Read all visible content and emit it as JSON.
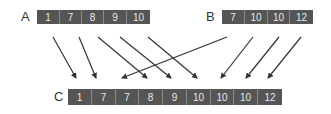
{
  "diagram": {
    "colors": {
      "cell_fill": "#555555",
      "cell_text": "#e8e8e8",
      "cell_divider": "#8a8a8a",
      "arrow": "#333333",
      "label": "#333333"
    },
    "arrays": {
      "A": {
        "label": "A",
        "values": [
          "1",
          "7",
          "8",
          "9",
          "10"
        ]
      },
      "B": {
        "label": "B",
        "values": [
          "7",
          "10",
          "10",
          "12"
        ]
      },
      "C": {
        "label": "C",
        "values": [
          "1",
          "7",
          "7",
          "8",
          "9",
          "10",
          "10",
          "10",
          "12"
        ]
      }
    },
    "arrows": [
      {
        "from": "A[0]",
        "to": "C[0]"
      },
      {
        "from": "A[1]",
        "to": "C[1]"
      },
      {
        "from": "B[0]",
        "to": "C[2]"
      },
      {
        "from": "A[2]",
        "to": "C[3]"
      },
      {
        "from": "A[3]",
        "to": "C[4]"
      },
      {
        "from": "A[4]",
        "to": "C[5]"
      },
      {
        "from": "B[1]",
        "to": "C[6]"
      },
      {
        "from": "B[2]",
        "to": "C[7]"
      },
      {
        "from": "B[3]",
        "to": "C[8]"
      }
    ]
  }
}
